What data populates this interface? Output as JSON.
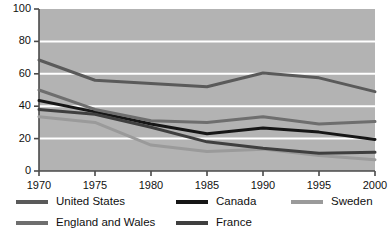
{
  "chart_data": {
    "type": "line",
    "title": "",
    "subtitle": "",
    "xlabel": "",
    "ylabel": "",
    "x": [
      1970,
      1975,
      1980,
      1985,
      1990,
      1995,
      2000
    ],
    "xtick_labels": [
      "1970",
      "1975",
      "1980",
      "1985",
      "1990",
      "1995",
      "2000"
    ],
    "ytick_labels": [
      "0",
      "20",
      "40",
      "60",
      "80",
      "100"
    ],
    "yticks": [
      0,
      20,
      40,
      60,
      80,
      100
    ],
    "xlim": [
      1970,
      2000
    ],
    "ylim": [
      0,
      100
    ],
    "grid": "horizontal-white-gridlines",
    "plot_background": "#b3b3b3",
    "legend_position": "below-axis",
    "series": [
      {
        "name": "United States",
        "color": "#5a5a5a",
        "values": [
          68.5,
          56.0,
          54.0,
          52.0,
          60.5,
          57.5,
          49.0
        ]
      },
      {
        "name": "Canada",
        "color": "#161616",
        "values": [
          43.5,
          36.5,
          29.0,
          23.0,
          26.5,
          24.0,
          19.5
        ]
      },
      {
        "name": "Sweden",
        "color": "#9a9a9a",
        "values": [
          33.5,
          30.0,
          16.0,
          12.0,
          13.5,
          9.5,
          7.0
        ]
      },
      {
        "name": "England and Wales",
        "color": "#6e6e6e",
        "values": [
          50.0,
          38.0,
          31.0,
          30.0,
          33.5,
          29.0,
          30.5
        ]
      },
      {
        "name": "France",
        "color": "#3f3f3f",
        "values": [
          38.0,
          35.0,
          27.0,
          18.0,
          14.0,
          11.0,
          11.5
        ]
      }
    ]
  },
  "legend": {
    "items": [
      {
        "label": "United States",
        "color": "#5a5a5a"
      },
      {
        "label": "Canada",
        "color": "#161616"
      },
      {
        "label": "Sweden",
        "color": "#9a9a9a"
      },
      {
        "label": "England and Wales",
        "color": "#6e6e6e"
      },
      {
        "label": "France",
        "color": "#3f3f3f"
      }
    ]
  },
  "axes": {
    "axis_color": "#4a4a4a",
    "gridline_color": "#ffffff",
    "tick_text_color": "#111111"
  }
}
